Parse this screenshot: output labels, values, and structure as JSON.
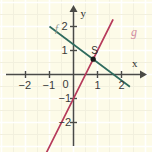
{
  "figure": {
    "background_color": "#fdfbe8",
    "grid_color": "#f2f0de",
    "grid_highlight_color": "#ffffff",
    "axis_color": "#4a4a46"
  },
  "axes": {
    "x_axis_name": "x",
    "y_axis_name": "y",
    "x_ticks": [
      {
        "value": -2,
        "label": "−2"
      },
      {
        "value": -1,
        "label": "−1"
      },
      {
        "value": 1,
        "label": "1"
      },
      {
        "value": 2,
        "label": "2"
      }
    ],
    "y_ticks": [
      {
        "value": 2,
        "label": "2"
      },
      {
        "value": 1,
        "label": "1"
      },
      {
        "value": -1,
        "label": "−1"
      },
      {
        "value": -2,
        "label": "−2"
      }
    ],
    "origin_label": "0",
    "xlim": [
      -2.45,
      2.35
    ],
    "ylim": [
      -2.45,
      2.45
    ],
    "grid_step": 0.5
  },
  "chart_data": {
    "type": "line",
    "title": "",
    "xlabel": "x",
    "ylabel": "y",
    "xlim": [
      -2.45,
      2.35
    ],
    "ylim": [
      -2.45,
      2.45
    ],
    "grid": true,
    "legend": "inline-labels",
    "series": [
      {
        "name": "f",
        "label": "f",
        "color": "#2f6b5e",
        "slope": -0.75,
        "intercept": 1.25,
        "x_endpoints": [
          -1.0,
          2.35
        ],
        "y_endpoints": [
          2.0,
          -0.51
        ]
      },
      {
        "name": "g",
        "label": "g",
        "color": "#b6395a",
        "slope": 2.0,
        "intercept": -1.0,
        "x_endpoints": [
          -1.7,
          1.65
        ],
        "y_endpoints": [
          -2.4,
          2.3
        ]
      }
    ],
    "points": [
      {
        "name": "S",
        "label": "S",
        "x": 0.82,
        "y": 0.64,
        "color": "#1a1a1a"
      }
    ]
  }
}
